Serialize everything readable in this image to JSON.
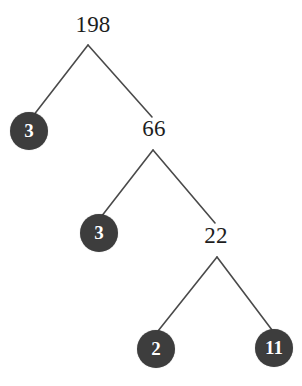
{
  "diagram": {
    "kind": "factor-tree",
    "background_color": "#ffffff",
    "edge_color": "#4a4a4a",
    "circle_fill_color": "#3d3d3d",
    "circle_text_color": "#ffffff",
    "plain_text_color": "#1d1d1d",
    "nodes": [
      {
        "id": "root",
        "label": "198",
        "style": "plain",
        "x": 93,
        "y": 24
      },
      {
        "id": "n3a",
        "label": "3",
        "style": "circle",
        "x": 29,
        "y": 131
      },
      {
        "id": "n66",
        "label": "66",
        "style": "plain",
        "x": 154,
        "y": 128
      },
      {
        "id": "n3b",
        "label": "3",
        "style": "circle",
        "x": 99,
        "y": 233
      },
      {
        "id": "n22",
        "label": "22",
        "style": "plain",
        "x": 216,
        "y": 235
      },
      {
        "id": "n2",
        "label": "2",
        "style": "circle",
        "x": 156,
        "y": 349
      },
      {
        "id": "n11",
        "label": "11",
        "style": "circle",
        "x": 274,
        "y": 348
      }
    ],
    "edges": [
      {
        "from": "root",
        "to": "n3a",
        "x1": 88,
        "y1": 45,
        "x2": 33,
        "y2": 116
      },
      {
        "from": "root",
        "to": "n66",
        "x1": 88,
        "y1": 45,
        "x2": 152,
        "y2": 117
      },
      {
        "from": "n66",
        "to": "n3b",
        "x1": 153,
        "y1": 150,
        "x2": 101,
        "y2": 217
      },
      {
        "from": "n66",
        "to": "n22",
        "x1": 153,
        "y1": 150,
        "x2": 215,
        "y2": 223
      },
      {
        "from": "n22",
        "to": "n2",
        "x1": 217,
        "y1": 257,
        "x2": 158,
        "y2": 331
      },
      {
        "from": "n22",
        "to": "n11",
        "x1": 217,
        "y1": 257,
        "x2": 272,
        "y2": 330
      }
    ]
  }
}
